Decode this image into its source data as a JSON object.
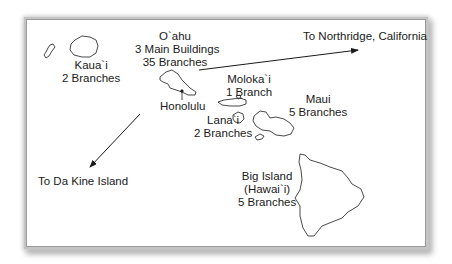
{
  "map": {
    "islands": [
      {
        "name": "Kaua`i",
        "detail": [
          "2 Branches"
        ]
      },
      {
        "name": "O`ahu",
        "detail": [
          "3 Main Buildings",
          "35 Branches"
        ]
      },
      {
        "name": "Moloka`i",
        "detail": [
          "1 Branch"
        ]
      },
      {
        "name": "Maui",
        "detail": [
          "5 Branches"
        ]
      },
      {
        "name": "Lana`i",
        "detail": [
          "2 Branches"
        ]
      },
      {
        "name": "Big Island",
        "detail": [
          "(Hawai`i)",
          "5 Branches"
        ]
      }
    ],
    "city": "Honolulu",
    "arrows": [
      {
        "label": "To Northridge, California"
      },
      {
        "label": "To Da Kine Island"
      }
    ],
    "colors": {
      "line": "#1a1a1a",
      "frame": "#9a9a9a",
      "background": "#ffffff"
    }
  }
}
